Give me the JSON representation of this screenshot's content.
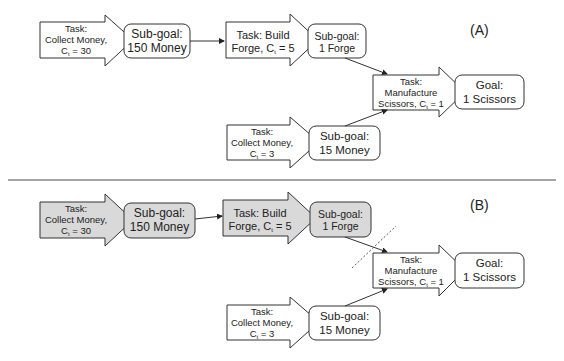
{
  "colors": {
    "stroke": "#333333",
    "highlight_fill": "#d9d9d9",
    "plain_fill": "#ffffff",
    "divider": "#888888"
  },
  "panels": [
    {
      "label": "(A)",
      "nodes": {
        "task_collect_30": {
          "line1": "Task:",
          "line2": "Collect Money,",
          "line3": "C",
          "sub": "t",
          "line3b": " = 30"
        },
        "subgoal_150": {
          "line1": "Sub-goal:",
          "line2": "150 Money"
        },
        "task_forge": {
          "line1": "Task: Build",
          "line2": "Forge, C",
          "sub": "t",
          "line2b": " = 5"
        },
        "subgoal_forge": {
          "line1": "Sub-goal:",
          "line2": "1 Forge"
        },
        "task_scissors": {
          "line1": "Task:",
          "line2": "Manufacture",
          "line3": "Scissors, C",
          "sub": "t",
          "line3b": " = 1"
        },
        "goal": {
          "line1": "Goal:",
          "line2": "1 Scissors"
        },
        "task_collect_3": {
          "line1": "Task:",
          "line2": "Collect Money,",
          "line3": "C",
          "sub": "t",
          "line3b": " = 3"
        },
        "subgoal_15": {
          "line1": "Sub-goal:",
          "line2": "15 Money"
        }
      }
    },
    {
      "label": "(B)",
      "highlighted": [
        "task_collect_30",
        "subgoal_150",
        "task_forge",
        "subgoal_forge"
      ],
      "cut_line": true,
      "nodes": {
        "task_collect_30": {
          "line1": "Task:",
          "line2": "Collect Money,",
          "line3": "C",
          "sub": "t",
          "line3b": " = 30"
        },
        "subgoal_150": {
          "line1": "Sub-goal:",
          "line2": "150 Money"
        },
        "task_forge": {
          "line1": "Task: Build",
          "line2": "Forge, C",
          "sub": "t",
          "line2b": " = 5"
        },
        "subgoal_forge": {
          "line1": "Sub-goal:",
          "line2": "1 Forge"
        },
        "task_scissors": {
          "line1": "Task:",
          "line2": "Manufacture",
          "line3": "Scissors, C",
          "sub": "t",
          "line3b": " = 1"
        },
        "goal": {
          "line1": "Goal:",
          "line2": "1 Scissors"
        },
        "task_collect_3": {
          "line1": "Task:",
          "line2": "Collect Money,",
          "line3": "C",
          "sub": "t",
          "line3b": " = 3"
        },
        "subgoal_15": {
          "line1": "Sub-goal:",
          "line2": "15 Money"
        }
      }
    }
  ]
}
